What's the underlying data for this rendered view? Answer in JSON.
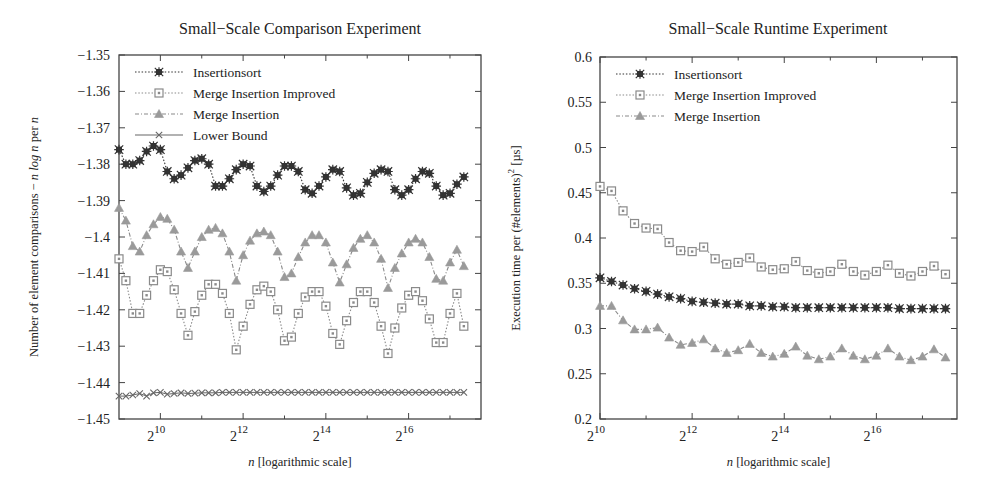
{
  "chart_data": [
    {
      "type": "line",
      "title": "Small−Scale Comparison Experiment",
      "xlabel_italic": "n",
      "xlabel_rest": " [logarithmic scale]",
      "ylabel": "Number of element comparisons − n log n per n",
      "ylabel_parts": [
        "Number of element comparisons − ",
        "n log n",
        " per ",
        "n"
      ],
      "xscale": "log2",
      "xlim_log2": [
        9.0,
        17.75
      ],
      "ylim": [
        -1.45,
        -1.35
      ],
      "yticks": [
        -1.35,
        -1.36,
        -1.37,
        -1.38,
        -1.39,
        -1.4,
        -1.41,
        -1.42,
        -1.43,
        -1.44,
        -1.45
      ],
      "ytick_labels": [
        "−1.35",
        "−1.36",
        "−1.37",
        "−1.38",
        "−1.39",
        "−1.4",
        "−1.41",
        "−1.42",
        "−1.43",
        "−1.44",
        "−1.45"
      ],
      "xticks_log2": [
        10,
        12,
        14,
        16
      ],
      "xtick_labels": [
        "2^10",
        "2^12",
        "2^14",
        "2^16"
      ],
      "minor_xticks_log2": [
        11,
        13,
        15,
        17
      ],
      "grid": false,
      "legend_position": "upper left",
      "x_log2_start": 9.0,
      "x_log2_step": 0.1667,
      "series": [
        {
          "name": "Insertionsort",
          "marker": "star",
          "line": "dotted",
          "color": "#333333",
          "values": [
            -1.376,
            -1.38,
            -1.38,
            -1.379,
            -1.3765,
            -1.375,
            -1.376,
            -1.382,
            -1.384,
            -1.383,
            -1.381,
            -1.379,
            -1.3785,
            -1.38,
            -1.386,
            -1.386,
            -1.384,
            -1.3815,
            -1.38,
            -1.3805,
            -1.386,
            -1.3875,
            -1.386,
            -1.383,
            -1.3805,
            -1.3805,
            -1.382,
            -1.387,
            -1.388,
            -1.386,
            -1.3835,
            -1.3815,
            -1.382,
            -1.3865,
            -1.3885,
            -1.388,
            -1.385,
            -1.3825,
            -1.3815,
            -1.382,
            -1.387,
            -1.3885,
            -1.387,
            -1.384,
            -1.382,
            -1.3825,
            -1.386,
            -1.3885,
            -1.388,
            -1.3855,
            -1.3835
          ]
        },
        {
          "name": "Merge Insertion Improved",
          "marker": "square",
          "line": "dotted",
          "color": "#8a8a8a",
          "values": [
            -1.406,
            -1.412,
            -1.421,
            -1.421,
            -1.416,
            -1.412,
            -1.409,
            -1.4095,
            -1.4145,
            -1.421,
            -1.427,
            -1.4205,
            -1.416,
            -1.413,
            -1.413,
            -1.4155,
            -1.421,
            -1.431,
            -1.4245,
            -1.4185,
            -1.4145,
            -1.4135,
            -1.415,
            -1.42,
            -1.4285,
            -1.4275,
            -1.421,
            -1.4165,
            -1.415,
            -1.415,
            -1.419,
            -1.4265,
            -1.4295,
            -1.423,
            -1.418,
            -1.415,
            -1.415,
            -1.418,
            -1.4245,
            -1.432,
            -1.425,
            -1.4195,
            -1.416,
            -1.415,
            -1.4175,
            -1.4225,
            -1.429,
            -1.429,
            -1.421,
            -1.4155,
            -1.4245
          ]
        },
        {
          "name": "Merge Insertion",
          "marker": "triangle",
          "line": "dashdot",
          "color": "#8a8a8a",
          "values": [
            -1.392,
            -1.3955,
            -1.4025,
            -1.404,
            -1.3995,
            -1.3965,
            -1.3945,
            -1.395,
            -1.398,
            -1.404,
            -1.4085,
            -1.404,
            -1.4,
            -1.398,
            -1.3975,
            -1.399,
            -1.404,
            -1.412,
            -1.405,
            -1.401,
            -1.399,
            -1.3985,
            -1.3995,
            -1.404,
            -1.411,
            -1.41,
            -1.4055,
            -1.4015,
            -1.3995,
            -1.3995,
            -1.4015,
            -1.407,
            -1.4125,
            -1.4075,
            -1.403,
            -1.4005,
            -1.3995,
            -1.4015,
            -1.406,
            -1.414,
            -1.4085,
            -1.4045,
            -1.4015,
            -1.4005,
            -1.4015,
            -1.4055,
            -1.4115,
            -1.412,
            -1.407,
            -1.4035,
            -1.408
          ]
        },
        {
          "name": "Lower Bound",
          "marker": "cross",
          "line": "solid",
          "color": "#666666",
          "constant": -1.4427,
          "values": [
            -1.4437,
            -1.4437,
            -1.4434,
            -1.443,
            -1.4437,
            -1.4428,
            -1.4427,
            -1.4432,
            -1.443,
            -1.4428,
            -1.443,
            -1.4429,
            -1.4428,
            -1.4428,
            -1.4428,
            -1.4427,
            -1.4427,
            -1.4427,
            -1.4427,
            -1.4427,
            -1.4427,
            -1.4427,
            -1.4427,
            -1.4427,
            -1.4427,
            -1.4427,
            -1.4427,
            -1.4427,
            -1.4427,
            -1.4427,
            -1.4427,
            -1.4427,
            -1.4427,
            -1.4427,
            -1.4427,
            -1.4427,
            -1.4427,
            -1.4427,
            -1.4427,
            -1.4427,
            -1.4427,
            -1.4427,
            -1.4427,
            -1.4427,
            -1.4427,
            -1.4427,
            -1.4427,
            -1.4427,
            -1.4427,
            -1.4427,
            -1.4427
          ]
        }
      ]
    },
    {
      "type": "line",
      "title": "Small−Scale Runtime Experiment",
      "xlabel_italic": "n",
      "xlabel_rest": " [logarithmic scale]",
      "ylabel": "Execution time per (#elements)^2 [µs]",
      "ylabel_main": "Execution time per (#elements)",
      "ylabel_sup": "2",
      "ylabel_unit": " [µs]",
      "xscale": "log2",
      "xlim_log2": [
        10.0,
        17.75
      ],
      "ylim": [
        0.2,
        0.6
      ],
      "yticks": [
        0.6,
        0.55,
        0.5,
        0.45,
        0.4,
        0.35,
        0.3,
        0.25,
        0.2
      ],
      "ytick_labels": [
        "0.6",
        "0.55",
        "0.5",
        "0.45",
        "0.4",
        "0.35",
        "0.3",
        "0.25",
        "0.2"
      ],
      "xticks_log2": [
        10,
        12,
        14,
        16
      ],
      "xtick_labels": [
        "2^10",
        "2^12",
        "2^14",
        "2^16"
      ],
      "minor_xticks_log2": [
        11,
        13,
        15,
        17
      ],
      "grid": false,
      "legend_position": "upper left",
      "x_log2_start": 10.0,
      "x_log2_step": 0.25,
      "series": [
        {
          "name": "Insertionsort",
          "marker": "star",
          "line": "dotted",
          "color": "#333333",
          "values": [
            0.356,
            0.352,
            0.348,
            0.344,
            0.341,
            0.338,
            0.335,
            0.333,
            0.33,
            0.329,
            0.328,
            0.327,
            0.327,
            0.325,
            0.325,
            0.324,
            0.324,
            0.323,
            0.323,
            0.323,
            0.323,
            0.323,
            0.323,
            0.323,
            0.323,
            0.323,
            0.322,
            0.322,
            0.322,
            0.322,
            0.322
          ]
        },
        {
          "name": "Merge Insertion Improved",
          "marker": "square",
          "line": "dotted",
          "color": "#8a8a8a",
          "values": [
            0.457,
            0.452,
            0.43,
            0.416,
            0.411,
            0.41,
            0.395,
            0.386,
            0.385,
            0.39,
            0.377,
            0.371,
            0.373,
            0.378,
            0.368,
            0.365,
            0.366,
            0.374,
            0.364,
            0.361,
            0.363,
            0.371,
            0.363,
            0.359,
            0.363,
            0.37,
            0.361,
            0.358,
            0.363,
            0.369,
            0.36
          ]
        },
        {
          "name": "Merge Insertion",
          "marker": "triangle",
          "line": "dashdot",
          "color": "#8a8a8a",
          "values": [
            0.325,
            0.325,
            0.309,
            0.299,
            0.299,
            0.301,
            0.29,
            0.282,
            0.284,
            0.288,
            0.278,
            0.273,
            0.276,
            0.283,
            0.273,
            0.269,
            0.272,
            0.28,
            0.27,
            0.266,
            0.269,
            0.278,
            0.27,
            0.266,
            0.27,
            0.278,
            0.269,
            0.265,
            0.269,
            0.277,
            0.268
          ]
        }
      ]
    }
  ]
}
